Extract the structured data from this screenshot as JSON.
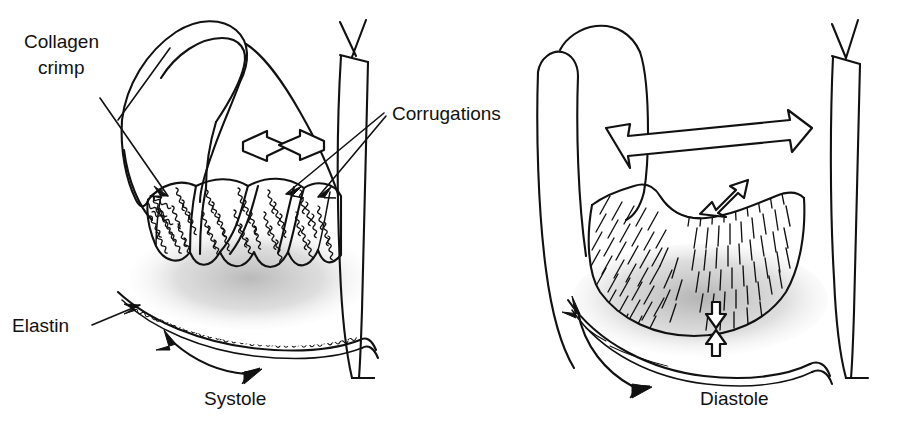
{
  "figure": {
    "background_color": "#ffffff",
    "ink_color": "#111111",
    "shadow_color": "#c9c9c9"
  },
  "labels": {
    "collagen_crimp_line1": "Collagen",
    "collagen_crimp_line2": "crimp",
    "corrugations": "Corrugations",
    "elastin": "Elastin"
  },
  "captions": {
    "left": "Systole",
    "right": "Diastole"
  },
  "panels": [
    {
      "id": "systole",
      "caption": "Systole",
      "state": "valve closed, leaflet relaxed",
      "features": [
        "collagen crimp",
        "corrugations",
        "elastin",
        "inward compression arrow",
        "elastin recoil double arrow"
      ],
      "arrows": [
        {
          "name": "compression-arrow",
          "style": "hollow",
          "direction": "inward-horizontal"
        },
        {
          "name": "elastin-recoil-arrow",
          "style": "solid",
          "direction": "bidirectional-curved"
        }
      ]
    },
    {
      "id": "diastole",
      "caption": "Diastole",
      "state": "valve open, leaflet stretched, collagen uncrimped",
      "features": [
        "straightened collagen fibers",
        "stretched elastin",
        "outward expansion arrow",
        "radial stretch arrow",
        "vertical compression arrow"
      ],
      "arrows": [
        {
          "name": "expansion-arrow",
          "style": "hollow",
          "direction": "outward-horizontal"
        },
        {
          "name": "radial-stretch-arrow",
          "style": "hollow",
          "direction": "bidirectional-diagonal"
        },
        {
          "name": "vertical-compression-arrow",
          "style": "hollow",
          "direction": "inward-vertical"
        },
        {
          "name": "elastin-stretch-arrow",
          "style": "solid",
          "direction": "bidirectional-curved"
        }
      ]
    }
  ],
  "leader_lines": [
    {
      "name": "collagen-crimp-leader",
      "from": "Collagen crimp",
      "to": "leaflet belly left"
    },
    {
      "name": "corrugations-leader-a",
      "from": "Corrugations",
      "to": "corrugation ridge center"
    },
    {
      "name": "corrugations-leader-b",
      "from": "Corrugations",
      "to": "corrugation ridge right"
    },
    {
      "name": "elastin-leader",
      "from": "Elastin",
      "to": "elastin band"
    }
  ]
}
